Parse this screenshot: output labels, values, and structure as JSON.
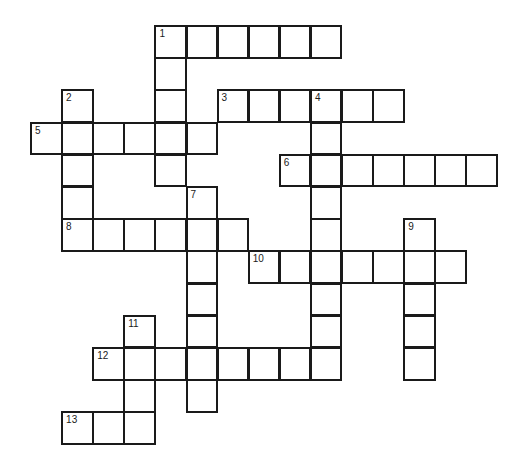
{
  "puzzle": {
    "type": "crossword",
    "grid": {
      "origin_x": 31,
      "origin_y": 26,
      "cell_w": 31.1,
      "cell_h": 32.2
    },
    "colors": {
      "line": "#1a1a1a",
      "background": "#ffffff"
    },
    "entries": [
      {
        "number": "1",
        "direction": "across",
        "row": 0,
        "col": 4,
        "length": 6
      },
      {
        "number": "1",
        "direction": "down",
        "row": 0,
        "col": 4,
        "length": 5
      },
      {
        "number": "2",
        "direction": "down",
        "row": 2,
        "col": 1,
        "length": 5
      },
      {
        "number": "3",
        "direction": "across",
        "row": 2,
        "col": 6,
        "length": 6
      },
      {
        "number": "4",
        "direction": "down",
        "row": 2,
        "col": 9,
        "length": 9
      },
      {
        "number": "5",
        "direction": "across",
        "row": 3,
        "col": 0,
        "length": 6
      },
      {
        "number": "6",
        "direction": "across",
        "row": 4,
        "col": 8,
        "length": 7
      },
      {
        "number": "7",
        "direction": "down",
        "row": 5,
        "col": 5,
        "length": 7
      },
      {
        "number": "8",
        "direction": "across",
        "row": 6,
        "col": 1,
        "length": 6
      },
      {
        "number": "9",
        "direction": "down",
        "row": 6,
        "col": 12,
        "length": 5
      },
      {
        "number": "10",
        "direction": "across",
        "row": 7,
        "col": 7,
        "length": 7
      },
      {
        "number": "11",
        "direction": "down",
        "row": 9,
        "col": 3,
        "length": 4
      },
      {
        "number": "12",
        "direction": "across",
        "row": 10,
        "col": 2,
        "length": 8
      },
      {
        "number": "13",
        "direction": "across",
        "row": 12,
        "col": 1,
        "length": 3
      }
    ]
  }
}
